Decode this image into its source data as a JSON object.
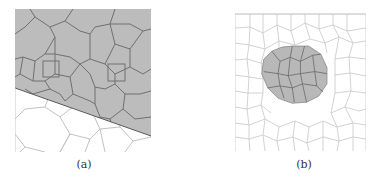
{
  "figure": {
    "panels": [
      {
        "id": "a",
        "caption": "(a)",
        "description": "Polygonal (Voronoi-like) mesh with upper region shaded gray, separated by a diagonal line",
        "fill_color": "#b9b9b9",
        "edge_color_shaded": "#6e6e6e",
        "edge_color_unshaded": "#bdbdbd"
      },
      {
        "id": "b",
        "caption": "(b)",
        "description": "Irregular quadrilateral mesh with circular shaded inclusion region",
        "fill_color": "#b5b5b5",
        "edge_color_shaded": "#707070",
        "edge_color_unshaded": "#c4c4c4"
      }
    ]
  }
}
